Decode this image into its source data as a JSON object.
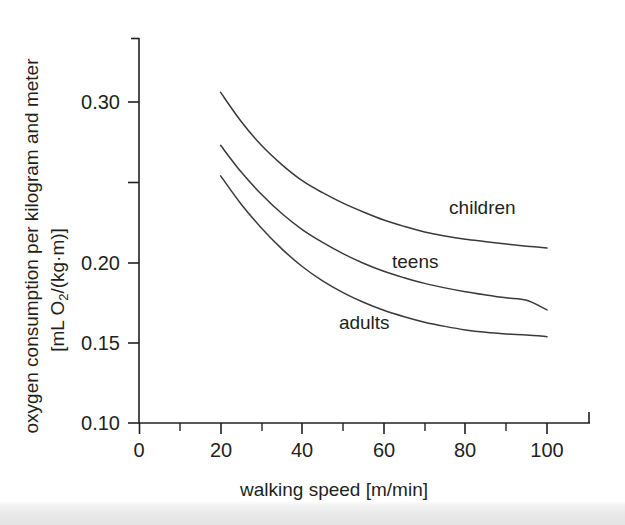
{
  "chart_data": {
    "type": "line",
    "title": "",
    "xlabel": "walking speed  [m/min]",
    "ylabel_line1": "oxygen consumption per kilogram and meter",
    "ylabel_line2_prefix": "[mL O",
    "ylabel_line2_sub": "2",
    "ylabel_line2_suffix": "/(kg·m)]",
    "xlim": [
      0,
      111
    ],
    "ylim": [
      0.1,
      0.3275
    ],
    "xticks": [
      0,
      10,
      20,
      30,
      40,
      50,
      60,
      70,
      80,
      90,
      100,
      110
    ],
    "xtick_labels": [
      "0",
      "",
      "20",
      "",
      "40",
      "",
      "60",
      "",
      "80",
      "",
      "100",
      ""
    ],
    "yticks": [
      0.1,
      0.15,
      0.2,
      0.25,
      0.3
    ],
    "ytick_labels": [
      "0.10",
      "0.15",
      "0.20",
      "0.25",
      "0.30"
    ],
    "ytick_labels_visible": [
      "0.10",
      "0.15",
      "0.20",
      "",
      "0.30"
    ],
    "grid": false,
    "legend_position": "inline-annotations",
    "x": [
      20,
      25,
      30,
      35,
      40,
      45,
      50,
      55,
      60,
      65,
      70,
      75,
      80,
      85,
      90,
      95,
      100
    ],
    "series": [
      {
        "name": "children",
        "label": "children",
        "label_x": 76,
        "label_y": 0.2305,
        "values": [
          0.306,
          0.288,
          0.273,
          0.261,
          0.251,
          0.2435,
          0.237,
          0.2315,
          0.2265,
          0.2225,
          0.219,
          0.2165,
          0.2145,
          0.213,
          0.2115,
          0.2102,
          0.209
        ]
      },
      {
        "name": "teens",
        "label": "teens",
        "label_x": 62,
        "label_y": 0.1965,
        "values": [
          0.273,
          0.2565,
          0.2425,
          0.2305,
          0.2205,
          0.2125,
          0.2055,
          0.1995,
          0.1945,
          0.1905,
          0.187,
          0.1842,
          0.1818,
          0.1798,
          0.178,
          0.1765,
          0.1705
        ]
      },
      {
        "name": "adults",
        "label": "adults",
        "label_x": 49,
        "label_y": 0.1585,
        "values": [
          0.254,
          0.2365,
          0.2215,
          0.2085,
          0.1975,
          0.1885,
          0.1812,
          0.1752,
          0.1702,
          0.1662,
          0.1628,
          0.1602,
          0.158,
          0.1565,
          0.1555,
          0.1548,
          0.1538
        ]
      }
    ],
    "colors": {
      "axis": "#231f20",
      "curve": "#3a3a3a",
      "background": "#ffffff"
    }
  }
}
